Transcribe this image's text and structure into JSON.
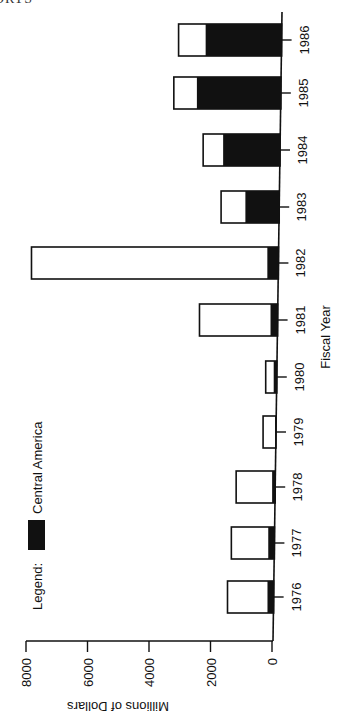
{
  "page": {
    "header_fragment": "ORTS"
  },
  "chart_data": {
    "type": "bar",
    "stacked": true,
    "orientation": "vertical bars, figure rotated 90° clockwise on page",
    "title": "",
    "xlabel": "Fiscal Year",
    "ylabel": "Millions of Dollars",
    "categories": [
      "1976",
      "1977",
      "1978",
      "1979",
      "1980",
      "1981",
      "1982",
      "1983",
      "1984",
      "1985",
      "1986"
    ],
    "series": [
      {
        "name": "Central America",
        "color": "#111111",
        "values": [
          200,
          200,
          100,
          30,
          100,
          230,
          360,
          1100,
          1850,
          2730,
          2470
        ]
      },
      {
        "name": "Other (remainder of total)",
        "color": "#ffffff",
        "values": [
          1300,
          1200,
          1170,
          390,
          260,
          2310,
          7670,
          790,
          650,
          750,
          880
        ]
      }
    ],
    "totals": [
      1500,
      1400,
      1270,
      420,
      360,
      2540,
      8030,
      1890,
      2500,
      3480,
      3350
    ],
    "yticks": [
      0,
      2000,
      4000,
      6000,
      8000
    ],
    "ylim": [
      0,
      8800
    ],
    "grid": false,
    "legend": {
      "label": "Legend:",
      "entries": [
        {
          "name": "Central America",
          "swatch": "#111111"
        }
      ],
      "position": "inside plot, near 1977–1980 region"
    }
  }
}
